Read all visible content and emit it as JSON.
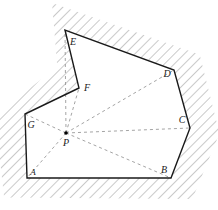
{
  "figure": {
    "canvas": {
      "width": 218,
      "height": 210
    },
    "colors": {
      "background": "#ffffff",
      "outline": "#1a1a1a",
      "hatch": "#7a7a7a",
      "dashed": "#9a9a9a",
      "label": "#1a1a1a",
      "point": "#000000"
    },
    "styles": {
      "outline_width": 1.4,
      "hatch_width": 0.8,
      "hatch_spacing": 7,
      "hatch_angle_deg": 45,
      "dash_pattern": "3,3"
    }
  },
  "polygon": {
    "name": "ABCDEFG",
    "closed": true,
    "vertices": [
      {
        "id": "A",
        "x": 27,
        "y": 178,
        "label": "A",
        "label_x": 33,
        "label_y": 172
      },
      {
        "id": "B",
        "x": 171,
        "y": 178,
        "label": "B",
        "label_x": 164,
        "label_y": 170
      },
      {
        "id": "C",
        "x": 190,
        "y": 128,
        "label": "C",
        "label_x": 182,
        "label_y": 120
      },
      {
        "id": "D",
        "x": 174,
        "y": 70,
        "label": "D",
        "label_x": 167,
        "label_y": 74
      },
      {
        "id": "E",
        "x": 65,
        "y": 30,
        "label": "E",
        "label_x": 73,
        "label_y": 42
      },
      {
        "id": "F",
        "x": 79,
        "y": 88,
        "label": "F",
        "label_x": 87,
        "label_y": 88
      },
      {
        "id": "G",
        "x": 25,
        "y": 114,
        "label": "G",
        "label_x": 31,
        "label_y": 125
      }
    ]
  },
  "interior_point": {
    "id": "P",
    "x": 66,
    "y": 133,
    "label": "P",
    "label_x": 66,
    "label_y": 143,
    "dot_radius": 1.8,
    "connects_to": [
      "A",
      "B",
      "C",
      "D",
      "E",
      "F",
      "G"
    ]
  },
  "exterior_region": {
    "description": "hatched area outside polygon",
    "hatched": true
  }
}
